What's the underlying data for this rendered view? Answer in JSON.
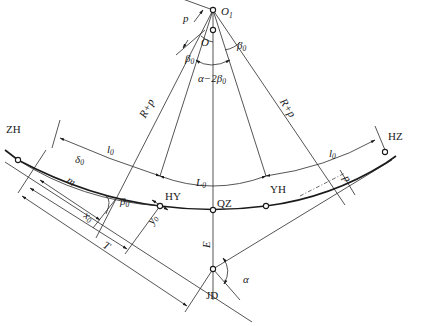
{
  "diagram": {
    "type": "highway transition-curve (spiral) geometry",
    "points": {
      "O1": "O",
      "O1_sub": "1",
      "O": "O",
      "ZH": "ZH",
      "HY": "HY",
      "QZ": "QZ",
      "YH": "YH",
      "HZ": "HZ",
      "JD": "JD"
    },
    "labels": {
      "p": "p",
      "R_plus_p_left": "R+p",
      "R_plus_p_right": "R+p",
      "beta0": "β",
      "zero": "0",
      "alpha_minus_2beta0": "α−2β",
      "l0": "l",
      "L0": "L",
      "delta0": "δ",
      "m": "m",
      "x0": "x",
      "y0": "y",
      "T": "T",
      "E": "E",
      "alpha": "α",
      "p_small": "p"
    }
  }
}
